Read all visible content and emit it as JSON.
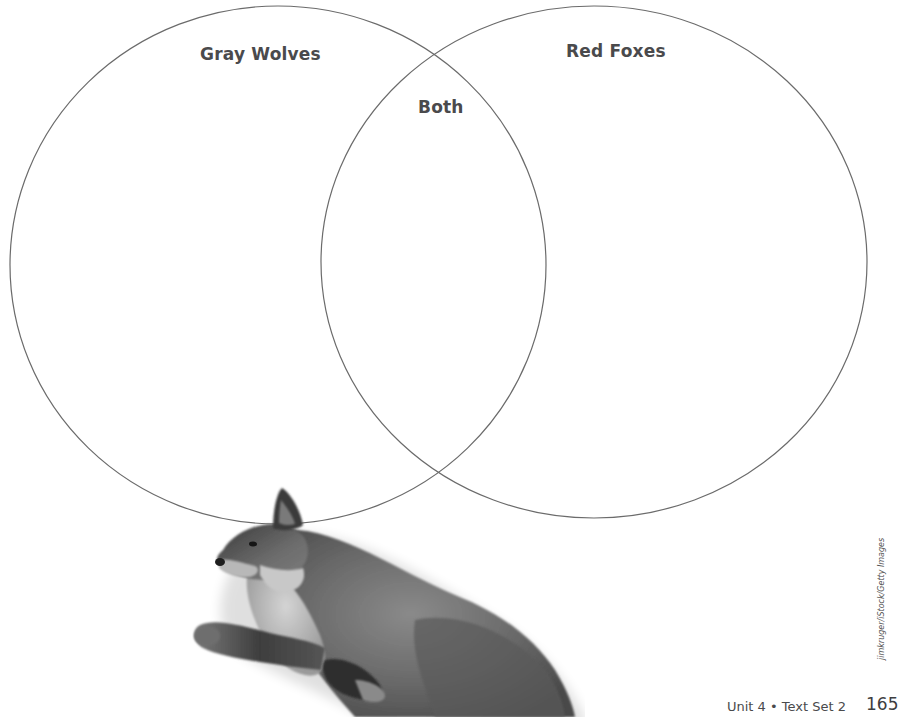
{
  "diagram": {
    "type": "venn",
    "circles": [
      {
        "id": "left",
        "label": "Gray Wolves",
        "cx": 278,
        "cy": 265,
        "rx": 268,
        "ry": 259
      },
      {
        "id": "right",
        "label": "Red Foxes",
        "cx": 594,
        "cy": 262,
        "rx": 273,
        "ry": 256
      }
    ],
    "overlap_label": "Both",
    "stroke_color": "#6b6b6b",
    "label_color": "#4a4a4c"
  },
  "labels": {
    "left": "Gray Wolves",
    "right": "Red Foxes",
    "both": "Both"
  },
  "image": {
    "subject": "red fox leaping (grayscale photo)",
    "credit": "jimkruger/iStock/Getty Images"
  },
  "footer": {
    "unit_line": "Unit 4 • Text Set 2",
    "page_number": "165"
  }
}
